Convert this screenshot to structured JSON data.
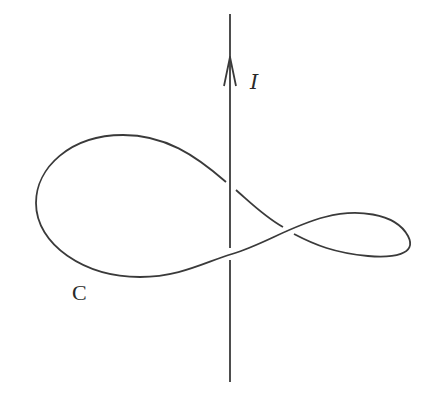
{
  "diagram": {
    "wire": {
      "label": "I",
      "direction": "up"
    },
    "curve": {
      "label": "C"
    },
    "colors": {
      "line": "#3a3a3a",
      "background": "#ffffff"
    }
  }
}
